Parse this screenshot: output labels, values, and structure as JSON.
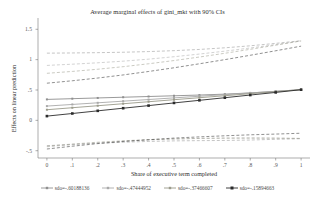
{
  "chart_data": {
    "type": "line",
    "title": "Average marginal effects of gini_mkt with 90% CIs",
    "xlabel": "Share of executive term completed",
    "ylabel": "Effects on linear prediction",
    "x": [
      0,
      0.1,
      0.2,
      0.3,
      0.4,
      0.5,
      0.6,
      0.7,
      0.8,
      0.9,
      1
    ],
    "xticklabels": [
      "0",
      ".1",
      ".2",
      ".3",
      ".4",
      ".5",
      ".6",
      ".7",
      ".8",
      ".9",
      "1"
    ],
    "yticklabels": [
      "1.5",
      "1",
      ".5",
      "0",
      "-.5"
    ],
    "yticks": [
      1.5,
      1.0,
      0.5,
      0.0,
      -0.5
    ],
    "ylim": [
      -0.62,
      1.62
    ],
    "xlim": [
      -0.035,
      1.035
    ],
    "grid": false,
    "legend_position": "bottom",
    "ci_level": "90%",
    "ci_style": "dashed",
    "marker": "square",
    "series": [
      {
        "name": "sdo=-.60188136",
        "color": "#8f8f8f",
        "values": [
          0.345,
          0.357,
          0.369,
          0.381,
          0.393,
          0.405,
          0.417,
          0.432,
          0.452,
          0.478,
          0.505
        ],
        "ci_upper": [
          1.107,
          1.11,
          1.115,
          1.122,
          1.133,
          1.148,
          1.168,
          1.195,
          1.228,
          1.268,
          1.312
        ],
        "ci_lower": [
          -0.417,
          -0.396,
          -0.377,
          -0.36,
          -0.347,
          -0.338,
          -0.334,
          -0.331,
          -0.324,
          -0.312,
          -0.302
        ]
      },
      {
        "name": "sdo=-.47444952",
        "color": "#a9a9a9",
        "values": [
          0.235,
          0.262,
          0.289,
          0.316,
          0.343,
          0.37,
          0.397,
          0.424,
          0.451,
          0.478,
          0.505
        ],
        "ci_upper": [
          0.905,
          0.925,
          0.948,
          0.975,
          1.008,
          1.048,
          1.092,
          1.14,
          1.192,
          1.248,
          1.308
        ],
        "ci_lower": [
          -0.435,
          -0.401,
          -0.37,
          -0.343,
          -0.322,
          -0.308,
          -0.298,
          -0.292,
          -0.29,
          -0.292,
          -0.298
        ]
      },
      {
        "name": "sdo=-.37466607",
        "color": "#9a9a8a",
        "values": [
          0.175,
          0.208,
          0.241,
          0.274,
          0.307,
          0.34,
          0.373,
          0.406,
          0.439,
          0.472,
          0.505
        ],
        "ci_upper": [
          0.775,
          0.806,
          0.842,
          0.884,
          0.932,
          0.985,
          1.043,
          1.105,
          1.17,
          1.238,
          1.308
        ],
        "ci_lower": [
          -0.425,
          -0.39,
          -0.36,
          -0.336,
          -0.318,
          -0.305,
          -0.297,
          -0.293,
          -0.292,
          -0.294,
          -0.298
        ]
      },
      {
        "name": "sdo=-.15894663",
        "color": "#2b2b2b",
        "values": [
          0.07,
          0.113,
          0.157,
          0.2,
          0.243,
          0.287,
          0.33,
          0.373,
          0.417,
          0.46,
          0.505
        ],
        "ci_upper": [
          0.612,
          0.652,
          0.697,
          0.748,
          0.805,
          0.866,
          0.932,
          1.0,
          1.072,
          1.146,
          1.222
        ],
        "ci_lower": [
          -0.472,
          -0.426,
          -0.383,
          -0.348,
          -0.319,
          -0.292,
          -0.272,
          -0.254,
          -0.238,
          -0.226,
          -0.212
        ]
      }
    ]
  },
  "legend": {
    "items": [
      {
        "label": "sdo=-.60188136",
        "marker": "square-line"
      },
      {
        "label": "sdo=-.47444952",
        "marker": "square-line"
      },
      {
        "label": "sdo=-.37466607",
        "marker": "square-line"
      },
      {
        "label": "sdo=-.15894663",
        "marker": "square-line"
      }
    ]
  }
}
